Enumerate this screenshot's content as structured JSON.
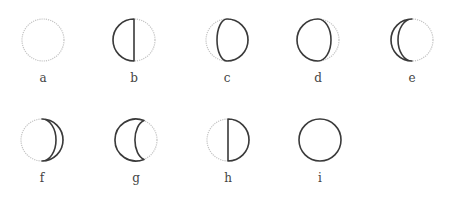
{
  "diagram": {
    "type": "lunar-phase-illustration",
    "radius": 21,
    "colors": {
      "lit_outline": "#c4c4c4",
      "dark_outline": "#3a3a3a",
      "label": "#444444",
      "background": "#ffffff"
    },
    "phases": [
      {
        "label": "a",
        "cx": 43,
        "cy": 40,
        "shape": "none",
        "description": "fully light circle (dotted outline)"
      },
      {
        "label": "b",
        "cx": 134,
        "cy": 40,
        "shape": "left-half",
        "description": "left half outlined dark"
      },
      {
        "label": "c",
        "cx": 227,
        "cy": 40,
        "shape": "right-gibbous",
        "description": "right gibbous outlined dark"
      },
      {
        "label": "d",
        "cx": 318,
        "cy": 40,
        "shape": "left-gibbous",
        "description": "left gibbous outlined dark"
      },
      {
        "label": "e",
        "cx": 412,
        "cy": 40,
        "shape": "left-crescent",
        "description": "thin left crescent outlined dark"
      },
      {
        "label": "f",
        "cx": 42,
        "cy": 140,
        "shape": "right-crescent",
        "description": "thin right crescent outlined dark"
      },
      {
        "label": "g",
        "cx": 136,
        "cy": 140,
        "shape": "left-concave",
        "description": "left region with concave terminator outlined dark"
      },
      {
        "label": "h",
        "cx": 228,
        "cy": 140,
        "shape": "right-half",
        "description": "right half outlined dark"
      },
      {
        "label": "i",
        "cx": 320,
        "cy": 140,
        "shape": "full",
        "description": "full circle outlined dark"
      }
    ]
  }
}
